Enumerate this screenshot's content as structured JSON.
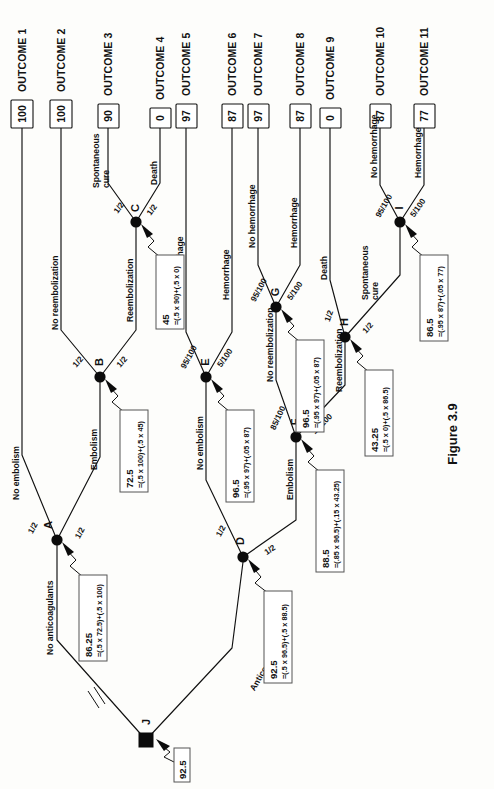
{
  "figure": {
    "caption": "Figure 3.9",
    "root_label": "J",
    "root_value": "92.5"
  },
  "outcomes": [
    {
      "id": "outcome-1",
      "label": "OUTCOME 1",
      "value": "100"
    },
    {
      "id": "outcome-2",
      "label": "OUTCOME 2",
      "value": "100"
    },
    {
      "id": "outcome-3",
      "label": "OUTCOME 3",
      "value": "90"
    },
    {
      "id": "outcome-4",
      "label": "OUTCOME 4",
      "value": "0"
    },
    {
      "id": "outcome-5",
      "label": "OUTCOME 5",
      "value": "97"
    },
    {
      "id": "outcome-6",
      "label": "OUTCOME 6",
      "value": "87"
    },
    {
      "id": "outcome-7",
      "label": "OUTCOME 7",
      "value": "97"
    },
    {
      "id": "outcome-8",
      "label": "OUTCOME 8",
      "value": "87"
    },
    {
      "id": "outcome-9",
      "label": "OUTCOME 9",
      "value": "0"
    },
    {
      "id": "outcome-10",
      "label": "OUTCOME 10",
      "value": "87"
    },
    {
      "id": "outcome-11",
      "label": "OUTCOME 11",
      "value": "77"
    }
  ],
  "nodes": {
    "A": {
      "label": "A",
      "value": "86.25",
      "expression": "=(.5 x 72.5)+(.5 x 100)"
    },
    "B": {
      "label": "B",
      "value": "72.5",
      "expression": "=(.5 x 100)+(.5 x 45)"
    },
    "C": {
      "label": "C",
      "value": "45",
      "expression": "=(.5 x 90)+(.5 x 0)"
    },
    "D": {
      "label": "D",
      "value": "92.5",
      "expression": "=(.5 x 96.5)+(.5 x 88.5)"
    },
    "E": {
      "label": "E",
      "value": "96.5",
      "expression": "=(.95 x 97)+(.05 x 87)"
    },
    "F": {
      "label": "F",
      "value": "88.5",
      "expression": "=(.85 x 96.5)+(.15 x 43.25)"
    },
    "G": {
      "label": "G",
      "value": "96.5",
      "expression": "=(.95 x 97)+(.05 x 87)"
    },
    "H": {
      "label": "H",
      "value": "43.25",
      "expression": "=(.5 x 0)+(.5 x 86.5)"
    },
    "I": {
      "label": "I",
      "value": "86.5",
      "expression": "=(.95 x 87)+(.05 x 77)"
    },
    "J": {
      "label": "J",
      "value": "92.5"
    }
  },
  "branches": {
    "no_anticoagulants": "No anticoagulants",
    "anticoagulants": "Anticoagulants",
    "no_embolism": "No embolism",
    "embolism": "Embolism",
    "no_reembolization": "No reembolization",
    "reembolization": "Reembolization",
    "spontaneous_cure": "Spontaneous\ncure",
    "spontaneous_cure_1": "Spontaneous",
    "spontaneous_cure_2": "cure",
    "death": "Death",
    "no_hemorrhage": "No hemorrhage",
    "hemorrhage": "Hemorrhage"
  },
  "probabilities": {
    "half": "1/2",
    "p95": "95/100",
    "p05": "5/100",
    "p85": "85/100",
    "p15": "15/100"
  },
  "colors": {
    "ink": "#111111",
    "paper": "#fdfdfb",
    "box_border": "#555555"
  }
}
